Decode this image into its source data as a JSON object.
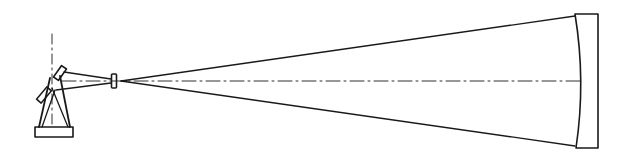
{
  "diagram": {
    "type": "optical-schematic",
    "stroke_color": "#1a1a1a",
    "background": "#ffffff",
    "components": [
      {
        "id": "instrument",
        "label": ""
      },
      {
        "id": "lens",
        "label": ""
      },
      {
        "id": "concave-mirror",
        "label": ""
      }
    ]
  }
}
